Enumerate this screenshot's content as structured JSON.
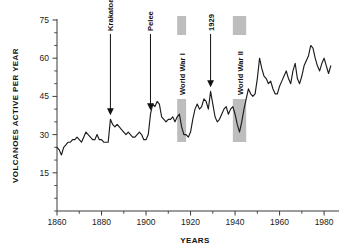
{
  "chart_data": {
    "type": "line",
    "title": "",
    "xlabel": "YEARS",
    "ylabel": "VOLCANOES ACTIVE PER YEAR",
    "xlim": [
      1860,
      1984
    ],
    "ylim": [
      0,
      75
    ],
    "xticks": [
      1860,
      1880,
      1900,
      1920,
      1940,
      1960,
      1980
    ],
    "yticks": [
      15,
      30,
      45,
      60,
      75
    ],
    "grid": false,
    "legend": null,
    "x": [
      1860,
      1861,
      1862,
      1863,
      1864,
      1865,
      1866,
      1867,
      1868,
      1869,
      1870,
      1871,
      1872,
      1873,
      1874,
      1875,
      1876,
      1877,
      1878,
      1879,
      1880,
      1881,
      1882,
      1883,
      1884,
      1885,
      1886,
      1887,
      1888,
      1889,
      1890,
      1891,
      1892,
      1893,
      1894,
      1895,
      1896,
      1897,
      1898,
      1899,
      1900,
      1901,
      1902,
      1903,
      1904,
      1905,
      1906,
      1907,
      1908,
      1909,
      1910,
      1911,
      1912,
      1913,
      1914,
      1915,
      1916,
      1917,
      1918,
      1919,
      1920,
      1921,
      1922,
      1923,
      1924,
      1925,
      1926,
      1927,
      1928,
      1929,
      1930,
      1931,
      1932,
      1933,
      1934,
      1935,
      1936,
      1937,
      1938,
      1939,
      1940,
      1941,
      1942,
      1943,
      1944,
      1945,
      1946,
      1947,
      1948,
      1949,
      1950,
      1951,
      1952,
      1953,
      1954,
      1955,
      1956,
      1957,
      1958,
      1959,
      1960,
      1961,
      1962,
      1963,
      1964,
      1965,
      1966,
      1967,
      1968,
      1969,
      1970,
      1971,
      1972,
      1973,
      1974,
      1975,
      1976,
      1977,
      1978,
      1979,
      1980,
      1981,
      1982,
      1983
    ],
    "values": [
      25,
      24,
      22,
      25,
      26,
      27,
      27,
      28,
      28,
      29,
      28,
      27,
      29,
      31,
      30,
      29,
      28,
      28,
      30,
      28,
      28,
      27,
      27,
      27,
      36,
      34,
      33,
      34,
      33,
      32,
      31,
      30,
      31,
      30,
      29,
      29,
      30,
      31,
      30,
      28,
      28,
      30,
      38,
      42,
      41,
      43,
      42,
      37,
      36,
      35,
      36,
      36,
      37,
      35,
      37,
      38,
      33,
      30,
      30,
      29,
      31,
      36,
      40,
      42,
      40,
      41,
      44,
      43,
      40,
      47,
      42,
      37,
      35,
      36,
      38,
      40,
      41,
      38,
      40,
      41,
      38,
      34,
      31,
      35,
      40,
      44,
      48,
      46,
      45,
      46,
      52,
      60,
      56,
      53,
      52,
      50,
      51,
      48,
      46,
      46,
      49,
      51,
      53,
      55,
      52,
      50,
      55,
      58,
      52,
      50,
      53,
      57,
      59,
      61,
      65,
      64,
      60,
      57,
      55,
      58,
      60,
      57,
      54,
      57
    ],
    "annotations": [
      {
        "label": "Krakatoa",
        "year": 1884,
        "value": 36
      },
      {
        "label": "Pelee",
        "year": 1902,
        "value": 38
      },
      {
        "label": "1929",
        "year": 1929,
        "value": 47
      }
    ],
    "bands": [
      {
        "label": "World War I",
        "start": 1914,
        "end": 1918
      },
      {
        "label": "World War II",
        "start": 1939,
        "end": 1945
      }
    ],
    "colors": {
      "line": "#1c1c1c",
      "axis": "#3b3b3b",
      "band": "#bdbdbd",
      "text": "#111111",
      "background": "#ffffff"
    }
  }
}
